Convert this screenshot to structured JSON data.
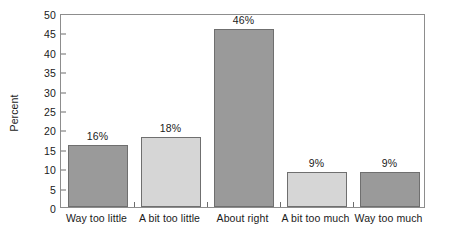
{
  "chart_data": {
    "type": "bar",
    "title": "",
    "subtitle": "",
    "xlabel": "",
    "ylabel": "Percent",
    "ylim": [
      0,
      50
    ],
    "yticks": [
      0,
      5,
      10,
      15,
      20,
      25,
      30,
      35,
      40,
      45,
      50
    ],
    "ytick_labels": [
      "0",
      "5",
      "10",
      "15",
      "20",
      "25",
      "30",
      "35",
      "40",
      "45",
      "50"
    ],
    "grid": false,
    "legend": false,
    "categories": [
      "Way too little",
      "A bit too little",
      "About right",
      "A bit too much",
      "Way too much"
    ],
    "values": [
      16,
      18,
      46,
      9,
      9
    ],
    "data_labels": [
      "16%",
      "18%",
      "46%",
      "9%",
      "9%"
    ],
    "bar_colors": [
      "#9a9a9a",
      "#d6d6d6",
      "#9a9a9a",
      "#d6d6d6",
      "#9a9a9a"
    ],
    "bar_edge_color": "#6f6f6f",
    "axis_color": "#8d8d8d",
    "text_color": "#1a1a1a",
    "background": "#ffffff"
  }
}
